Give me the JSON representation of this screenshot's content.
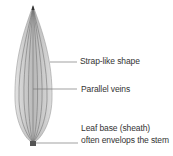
{
  "diagram": {
    "labels": [
      {
        "id": "shape",
        "text": "Strap-like shape"
      },
      {
        "id": "veins",
        "text": "Parallel veins"
      },
      {
        "id": "base_line1",
        "text": "Leaf base (sheath)"
      },
      {
        "id": "base_line2",
        "text": "often envelops the stem"
      }
    ],
    "colors": {
      "leaf_fill": "#c9c9c9",
      "leaf_center": "#b3b3b3",
      "vein": "#6e6e6e",
      "leader_line": "#7a7a7a",
      "text": "#333333"
    }
  }
}
